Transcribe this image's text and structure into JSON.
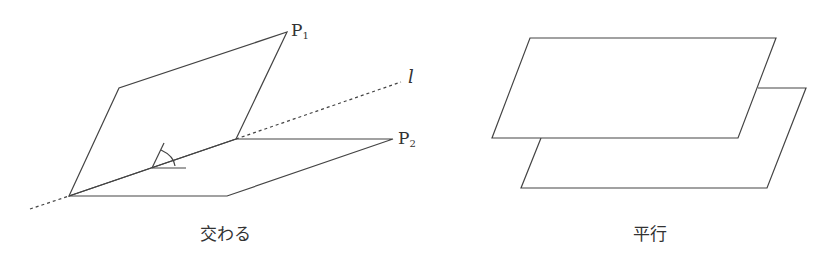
{
  "left_figure": {
    "caption": "交わる",
    "label_p1": "P",
    "label_p1_sub": "1",
    "label_p2": "P",
    "label_p2_sub": "2",
    "label_line": "l"
  },
  "right_figure": {
    "caption": "平行"
  },
  "colors": {
    "stroke": "#444444",
    "text": "#333333"
  }
}
